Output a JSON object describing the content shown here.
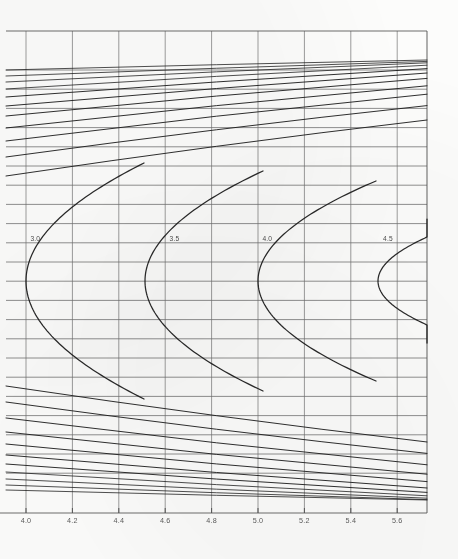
{
  "chart_data": {
    "type": "line",
    "title": "",
    "subtitle": "",
    "xlabel": "",
    "ylabel": "",
    "grid": true,
    "legend_position": "inline-labels",
    "xlim": [
      3.9,
      5.7
    ],
    "ylim": [
      0,
      22
    ],
    "x_ticks": [
      "4.0",
      "4.2",
      "4.4",
      "4.6",
      "4.8",
      "5.0",
      "5.2",
      "5.4",
      "5.6"
    ],
    "x_tick_values": [
      4.0,
      4.2,
      4.4,
      4.6,
      4.8,
      5.0,
      5.2,
      5.4,
      5.6
    ],
    "y_ticks": [],
    "y_tick_values": [],
    "horizontal_gridline_count": 22,
    "vertical_gridline_count": 9,
    "annotations": [
      {
        "label": "3.0",
        "x": 4.04,
        "y_px": 241
      },
      {
        "label": "3.5",
        "x": 4.64,
        "y_px": 241
      },
      {
        "label": "4.0",
        "x": 5.04,
        "y_px": 241
      },
      {
        "label": "4.5",
        "x": 5.56,
        "y_px": 241
      }
    ],
    "series": [
      {
        "name": "parabola-3.0",
        "label": "3.0",
        "kind": "parabola-open-right",
        "vertex_px": [
          26,
          281
        ],
        "width_px": 118,
        "half_height_px": 118
      },
      {
        "name": "parabola-3.5",
        "label": "3.5",
        "kind": "parabola-open-right",
        "vertex_px": [
          145,
          281
        ],
        "width_px": 118,
        "half_height_px": 110
      },
      {
        "name": "parabola-4.0",
        "label": "4.0",
        "kind": "parabola-open-right",
        "vertex_px": [
          258,
          281
        ],
        "width_px": 118,
        "half_height_px": 100
      },
      {
        "name": "parabola-4.5",
        "label": "4.5",
        "kind": "parabola-open-right",
        "vertex_px": [
          378,
          281
        ],
        "width_px": 98,
        "half_height_px": 62
      }
    ],
    "fan_lines": {
      "description": "Family of near-straight lines fanning from upper-left to lower-right, densest near the vertical center band.",
      "count": 22,
      "upper_y_px": [
        70,
        76,
        82,
        89,
        97,
        106,
        116,
        128,
        141,
        157,
        176
      ],
      "lower_y_px": [
        386,
        402,
        418,
        432,
        444,
        455,
        464,
        472,
        479,
        485,
        490
      ]
    },
    "axis": {
      "x_axis_y_px": 513,
      "plot_left_px": 6,
      "plot_right_px": 427,
      "plot_top_px": 31,
      "plot_bottom_px": 513
    },
    "colors": {
      "background": "#fcfcfb",
      "gridline": "#6e6e6e",
      "curve": "#1d1d1d",
      "axis": "#555555",
      "tick_label": "#5c5c5c"
    }
  }
}
